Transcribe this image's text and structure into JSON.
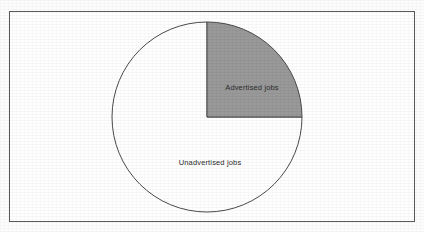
{
  "figure": {
    "frame": {
      "border_color": "#5a5a5a",
      "background_color": "#ffffff"
    },
    "background_color": "#fdfdfd"
  },
  "chart_data": {
    "type": "pie",
    "title": "",
    "subtitle": "",
    "xlabel": "",
    "ylabel": "",
    "grid": false,
    "legend": "none",
    "labels_position": "inside-slices",
    "start_angle_deg": 0,
    "direction": "clockwise",
    "categories": [
      "Advertised jobs",
      "Unadvertised jobs"
    ],
    "values": [
      25,
      75
    ],
    "value_unit": "percent",
    "slices": [
      {
        "label": "Advertised jobs",
        "value": 25,
        "angle_deg": 90,
        "color": "#999999",
        "stroke": "#4a4a4a"
      },
      {
        "label": "Unadvertised jobs",
        "value": 75,
        "angle_deg": 270,
        "color": "#ffffff",
        "stroke": "#4a4a4a"
      }
    ],
    "geometry": {
      "center_x": 207,
      "center_y": 117,
      "radius": 95
    }
  }
}
